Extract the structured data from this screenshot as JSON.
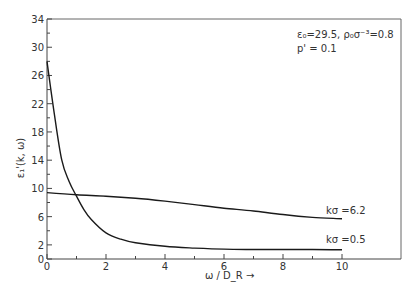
{
  "chart_data": {
    "type": "line",
    "title": "",
    "xlabel": "ω / D_R →",
    "ylabel": "ε₁'(k, ω)",
    "xlim": [
      0,
      12
    ],
    "ylim": [
      0,
      34
    ],
    "x_ticks": [
      0,
      2,
      4,
      6,
      8,
      10
    ],
    "x_minor_ticks": [
      1,
      3,
      5,
      7,
      9
    ],
    "y_ticks": [
      0,
      2,
      6,
      10,
      14,
      18,
      22,
      26,
      30,
      34
    ],
    "y_minor_ticks": [
      4,
      8,
      12,
      16,
      20,
      24,
      28,
      32
    ],
    "grid": false,
    "annotation": {
      "line1": "ε₀=29.5, ρ₀σ⁻³=0.8",
      "line2": "p' =  0.1"
    },
    "series": [
      {
        "name": "kσ =0.5",
        "x": [
          0,
          0.25,
          0.5,
          0.75,
          1.0,
          1.25,
          1.5,
          2.0,
          2.5,
          3.0,
          4.0,
          5.0,
          6.0,
          7.0,
          8.0,
          9.0,
          10.0
        ],
        "values": [
          28.0,
          20.5,
          14.0,
          11.0,
          8.9,
          7.0,
          5.6,
          3.7,
          2.8,
          2.3,
          1.8,
          1.55,
          1.4,
          1.35,
          1.35,
          1.35,
          1.3
        ]
      },
      {
        "name": "kσ =6.2",
        "x": [
          0,
          1,
          2,
          3,
          4,
          5,
          6,
          7,
          8,
          9,
          10
        ],
        "values": [
          9.4,
          9.1,
          8.9,
          8.6,
          8.2,
          7.7,
          7.2,
          6.8,
          6.3,
          5.9,
          5.7
        ]
      }
    ]
  }
}
